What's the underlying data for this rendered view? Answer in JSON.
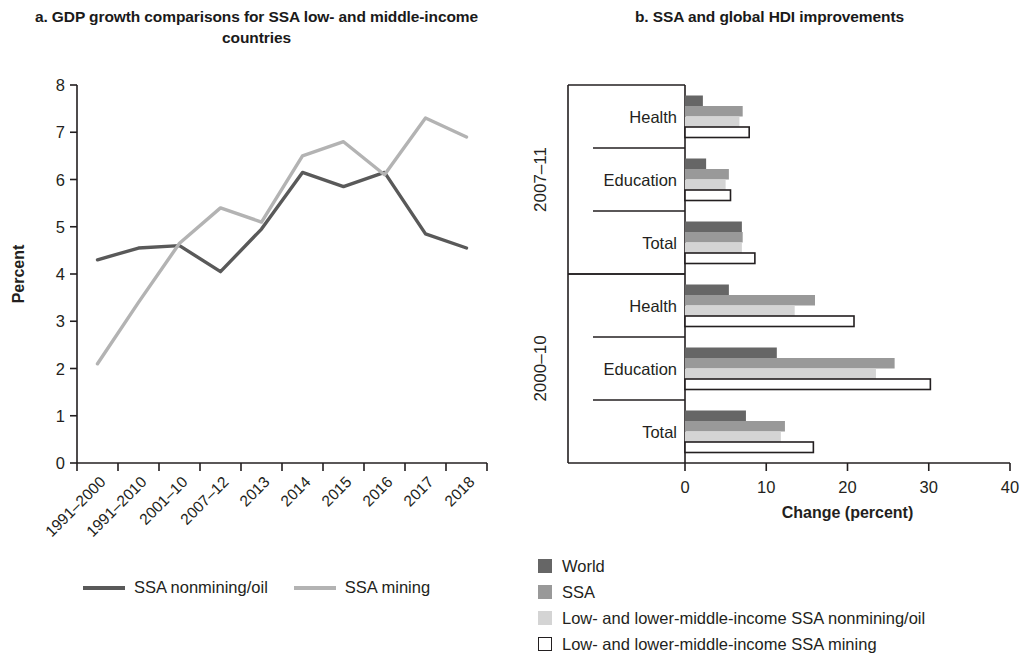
{
  "panel_a": {
    "title": "a. GDP growth comparisons for SSA low- and middle-income countries",
    "y_axis_label": "Percent",
    "legend": [
      {
        "label": "SSA nonmining/oil",
        "color": "#595959"
      },
      {
        "label": "SSA mining",
        "color": "#b3b3b3"
      }
    ]
  },
  "panel_b": {
    "title": "b. SSA and global HDI improvements",
    "x_axis_label": "Change (percent)",
    "legend": [
      {
        "label": "World",
        "color": "#666666"
      },
      {
        "label": "SSA",
        "color": "#999999"
      },
      {
        "label": "Low- and lower-middle-income SSA nonmining/oil",
        "color": "#d4d4d4"
      },
      {
        "label": "Low- and lower-middle-income SSA mining",
        "color": "#ffffff"
      }
    ]
  },
  "chart_data": [
    {
      "type": "line",
      "title": "a. GDP growth comparisons for SSA low- and middle-income countries",
      "xlabel": "",
      "ylabel": "Percent",
      "ylim": [
        0,
        8
      ],
      "yticks": [
        0,
        1,
        2,
        3,
        4,
        5,
        6,
        7,
        8
      ],
      "grid": false,
      "legend_position": "bottom",
      "categories": [
        "1991–2000",
        "1991–2010",
        "2001–10",
        "2007–12",
        "2013",
        "2014",
        "2015",
        "2016",
        "2017",
        "2018"
      ],
      "series": [
        {
          "name": "SSA nonmining/oil",
          "color": "#595959",
          "values": [
            4.3,
            4.55,
            4.6,
            4.05,
            4.95,
            6.15,
            5.85,
            6.15,
            4.85,
            4.55
          ]
        },
        {
          "name": "SSA mining",
          "color": "#b3b3b3",
          "values": [
            2.1,
            3.4,
            4.65,
            5.4,
            5.1,
            6.5,
            6.8,
            6.1,
            7.3,
            6.9
          ]
        }
      ]
    },
    {
      "type": "bar",
      "orientation": "horizontal",
      "title": "b. SSA and global HDI improvements",
      "xlabel": "Change (percent)",
      "ylabel": "",
      "xlim": [
        0,
        40
      ],
      "xticks": [
        0,
        10,
        20,
        30,
        40
      ],
      "grid": false,
      "legend_position": "bottom-left",
      "groups": [
        {
          "period": "2007–11",
          "categories": [
            "Health",
            "Education",
            "Total"
          ],
          "series": [
            {
              "name": "World",
              "color": "#666666",
              "values": [
                2.2,
                2.6,
                7.0
              ]
            },
            {
              "name": "SSA",
              "color": "#999999",
              "values": [
                7.1,
                5.4,
                7.1
              ]
            },
            {
              "name": "Low- and lower-middle-income SSA nonmining/oil",
              "color": "#d4d4d4",
              "values": [
                6.7,
                5.0,
                7.0
              ]
            },
            {
              "name": "Low- and lower-middle-income SSA mining",
              "color": "#ffffff",
              "values": [
                7.9,
                5.6,
                8.6
              ]
            }
          ]
        },
        {
          "period": "2000–10",
          "categories": [
            "Health",
            "Education",
            "Total"
          ],
          "series": [
            {
              "name": "World",
              "color": "#666666",
              "values": [
                5.4,
                11.3,
                7.5
              ]
            },
            {
              "name": "SSA",
              "color": "#999999",
              "values": [
                16.0,
                25.8,
                12.3
              ]
            },
            {
              "name": "Low- and lower-middle-income SSA nonmining/oil",
              "color": "#d4d4d4",
              "values": [
                13.5,
                23.5,
                11.8
              ]
            },
            {
              "name": "Low- and lower-middle-income SSA mining",
              "color": "#ffffff",
              "values": [
                20.8,
                30.2,
                15.8
              ]
            }
          ]
        }
      ]
    }
  ]
}
